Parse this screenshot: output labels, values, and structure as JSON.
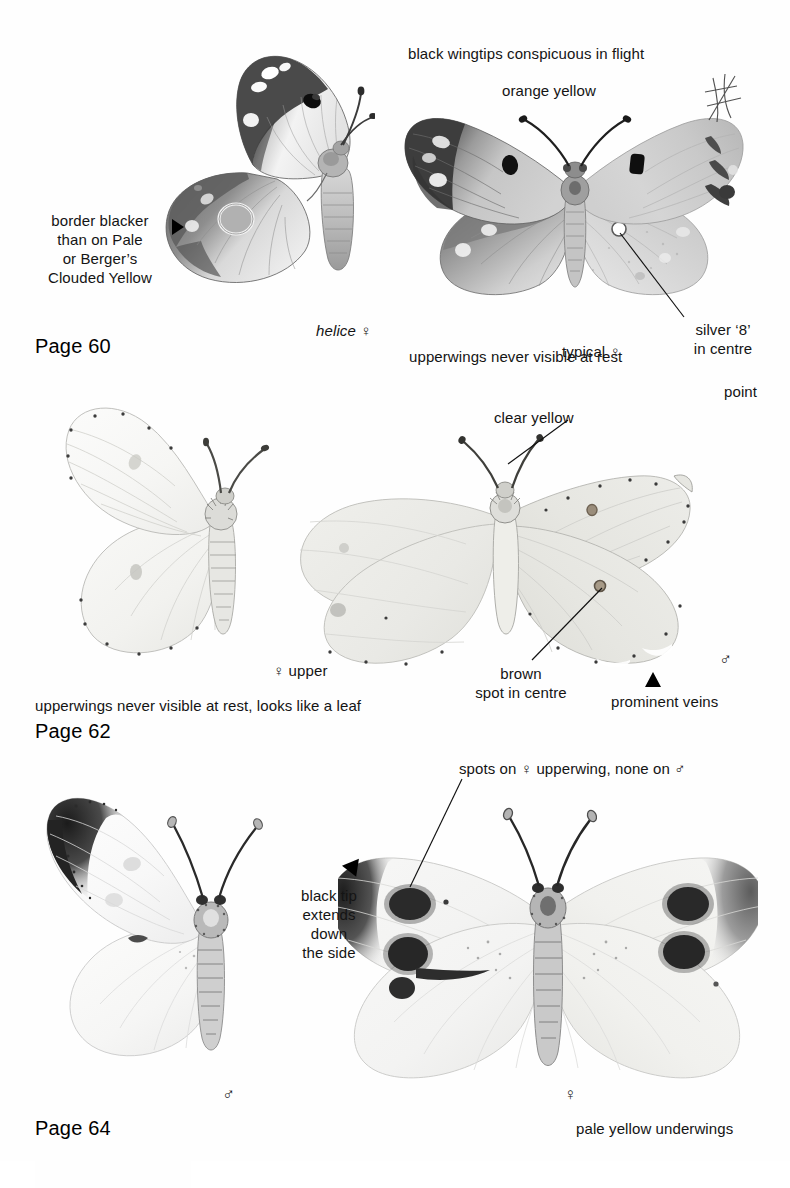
{
  "page": {
    "width": 790,
    "height": 1161,
    "background": "#ffffff",
    "ink": "#141414"
  },
  "sections": [
    {
      "id": "clouded-yellow",
      "heading_name": "Clouded Yellow",
      "heading_page": "Page 60",
      "labels": {
        "border_blacker": "border blacker\nthan on Pale\nor Berger’s\nClouded Yellow",
        "helice_form": "helice",
        "helice_sex": "♀",
        "black_wingtips": "black wingtips conspicuous in flight",
        "orange_yellow": "orange yellow",
        "typical": "typical",
        "typical_sex": "♀",
        "upperwings_note": "upperwings never visible at rest",
        "silver_eight": "silver ‘8’\nin centre"
      }
    },
    {
      "id": "brimstone",
      "heading_name": "Brimstone",
      "heading_page": "Page 62",
      "labels": {
        "female_upper": "♀ upper",
        "clear_yellow": "clear yellow",
        "point": "point",
        "brown_spot": "brown\nspot in centre",
        "prominent_veins": "prominent veins",
        "male_sex": "♂",
        "upperwings_note": "upperwings never visible at rest, looks like a leaf"
      }
    },
    {
      "id": "large-white",
      "heading_name": "Large White",
      "heading_page": "Page 64",
      "labels": {
        "black_tip": "black tip\nextends\ndown\nthe side",
        "male_sex": "♂",
        "spots_note": "spots on ♀ upperwing, none on ♂",
        "female_sex": "♀",
        "pale_yellow": "pale yellow underwings"
      }
    }
  ],
  "icons": {
    "arrow_right": "triangle-right-arrow",
    "arrow_up": "triangle-up-arrow",
    "arrow_upright": "triangle-upright-arrow"
  }
}
